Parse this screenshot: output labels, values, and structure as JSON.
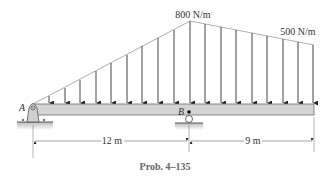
{
  "diagram": {
    "type": "beam-loading",
    "loads": {
      "peak_label": "800 N/m",
      "end_label": "500 N/m"
    },
    "supports": {
      "left_label": "A",
      "middle_label": "B"
    },
    "dimensions": {
      "left_span": "12 m",
      "right_span": "9 m"
    },
    "caption": "Prob. 4–135",
    "colors": {
      "beam_fill": "#d4d4d4",
      "beam_stroke": "#6e6e6e",
      "arrow": "#333333",
      "load_outline": "#9a9a9a",
      "text": "#333333"
    }
  }
}
